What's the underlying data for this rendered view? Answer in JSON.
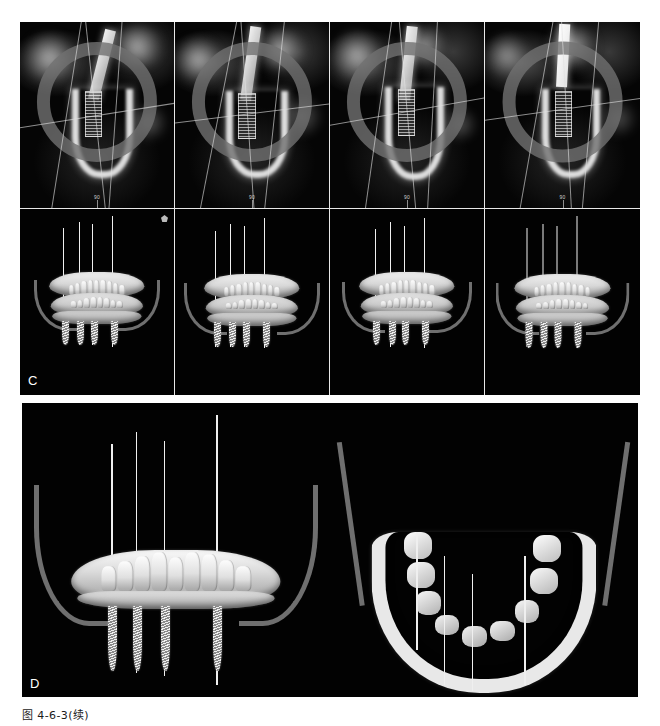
{
  "figure": {
    "caption": "图 4-6-3(续)",
    "panels": [
      {
        "letter": "C",
        "name": "panel-c",
        "description": "CBCT cross-sectional slices with implant planning overlay and corresponding 3D frontal renderings",
        "rows": [
          {
            "row_name": "cbct-slice-row",
            "views": [
              {
                "label": "90",
                "view_name": "cbct-cross-section-1"
              },
              {
                "label": "90",
                "view_name": "cbct-cross-section-2"
              },
              {
                "label": "90",
                "view_name": "cbct-cross-section-3"
              },
              {
                "label": "90",
                "view_name": "cbct-cross-section-4"
              }
            ]
          },
          {
            "row_name": "model-3d-row",
            "views": [
              {
                "view_name": "3d-frontal-view-1"
              },
              {
                "view_name": "3d-frontal-view-2"
              },
              {
                "view_name": "3d-frontal-view-3"
              },
              {
                "view_name": "3d-frontal-view-4"
              }
            ]
          }
        ]
      },
      {
        "letter": "D",
        "name": "panel-d",
        "description": "Large 3D renderings of the mandible with planned implants",
        "views": [
          {
            "view_name": "3d-anterior-view",
            "implant_count": 4
          },
          {
            "view_name": "3d-occlusal-view",
            "implant_count": 4
          }
        ]
      }
    ]
  },
  "colors": {
    "background": "#ffffff",
    "panel_background": "#000000",
    "divider": "#e8e8e8",
    "bone_highlight": "#f2f2f2",
    "canal_gray": "#6f6f6f",
    "ring_gray": "#707070",
    "axis_line": "#efefef",
    "caption_text": "#1a1a1a",
    "panel_letter": "#ffffff"
  }
}
